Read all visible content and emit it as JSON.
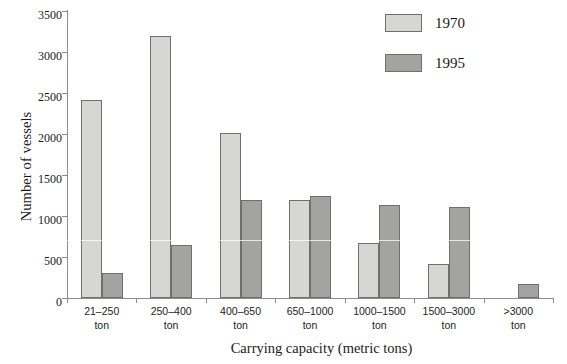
{
  "chart_data": {
    "type": "bar",
    "title": "",
    "xlabel": "Carrying capacity (metric tons)",
    "ylabel": "Number of vessels",
    "categories": [
      "21–250\nton",
      "250–400\nton",
      "400–650\nton",
      "650–1000\nton",
      "1000–1500\nton",
      "1500–3000\nton",
      ">3000\nton"
    ],
    "category_ranges": [
      "21–250",
      "250–400",
      "400–650",
      "650–1000",
      "1000–1500",
      "1500–3000",
      ">3000"
    ],
    "category_unit": "ton",
    "series": [
      {
        "name": "1970",
        "color": "#d6d6d4",
        "values": [
          2420,
          3200,
          2010,
          1200,
          670,
          410,
          0
        ]
      },
      {
        "name": "1995",
        "color": "#a3a3a1",
        "values": [
          300,
          650,
          1190,
          1250,
          1130,
          1105,
          165
        ]
      }
    ],
    "ylim": [
      0,
      3500
    ],
    "yticks": [
      0,
      500,
      1000,
      1500,
      2000,
      2500,
      3000,
      3500
    ],
    "ytick_labels": [
      "0",
      "500",
      "1000",
      "1500",
      "2000",
      "2500",
      "3000",
      "3500"
    ],
    "grid": false,
    "legend_position": "top-right",
    "legend_entries": [
      "1970",
      "1995"
    ],
    "axis_color": "#8d8d8d",
    "bar_edge_color": "#6f6f6f",
    "background": "#ffffff"
  }
}
